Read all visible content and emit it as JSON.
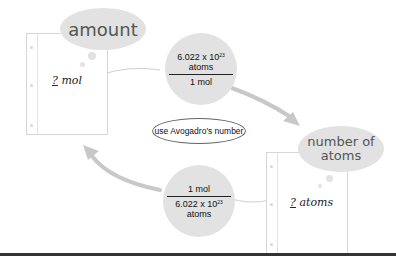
{
  "diagram": {
    "top_left_label": "amount",
    "top_left_card": {
      "unknown": "?",
      "unit": "mol"
    },
    "bottom_right_label": "number of atoms",
    "bottom_right_label_lines": [
      "number of",
      "atoms"
    ],
    "bottom_right_card": {
      "unknown": "?",
      "unit": "atoms"
    },
    "center_label": "use Avogadro's number",
    "conversion_top": {
      "numerator": {
        "base": "6.022 x 10",
        "exponent": "23",
        "unit": "atoms"
      },
      "denominator": "1 mol"
    },
    "conversion_bottom": {
      "numerator": "1 mol",
      "denominator": {
        "base": "6.022 x 10",
        "exponent": "23",
        "unit": "atoms"
      }
    },
    "colors": {
      "bubble": "#e2e2e2",
      "arrow": "#c8c8c8",
      "rule": "#333333"
    }
  }
}
